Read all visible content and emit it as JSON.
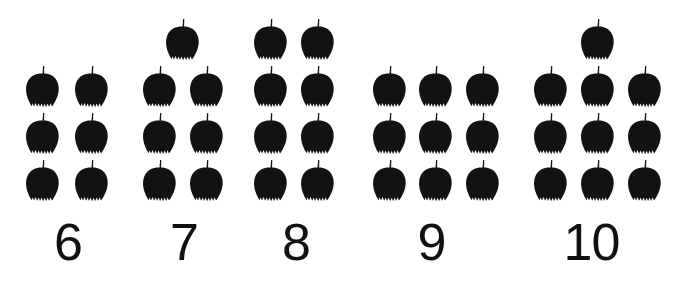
{
  "page": {
    "background_color": "#ffffff",
    "ink_color": "#111111",
    "apple_color": "#121212",
    "apple_icon_name": "apple-icon"
  },
  "groups": [
    {
      "id": "group-6",
      "label": "6",
      "count": 6,
      "columns": 2,
      "rows": 3,
      "has_extra_top_apple": false,
      "left": 0,
      "width": 136,
      "apple_positions": [
        {
          "x": 23,
          "y": 64
        },
        {
          "x": 72,
          "y": 64
        },
        {
          "x": 23,
          "y": 111
        },
        {
          "x": 72,
          "y": 111
        },
        {
          "x": 23,
          "y": 158
        },
        {
          "x": 72,
          "y": 158
        }
      ]
    },
    {
      "id": "group-7",
      "label": "7",
      "count": 7,
      "columns": 2,
      "rows": 3,
      "has_extra_top_apple": true,
      "left": 116,
      "width": 136,
      "apple_positions": [
        {
          "x": 47,
          "y": 17
        },
        {
          "x": 24,
          "y": 64
        },
        {
          "x": 71,
          "y": 64
        },
        {
          "x": 24,
          "y": 111
        },
        {
          "x": 71,
          "y": 111
        },
        {
          "x": 24,
          "y": 158
        },
        {
          "x": 71,
          "y": 158
        }
      ]
    },
    {
      "id": "group-8",
      "label": "8",
      "count": 8,
      "columns": 2,
      "rows": 4,
      "has_extra_top_apple": false,
      "left": 228,
      "width": 136,
      "apple_positions": [
        {
          "x": 23,
          "y": 17
        },
        {
          "x": 70,
          "y": 17
        },
        {
          "x": 23,
          "y": 64
        },
        {
          "x": 70,
          "y": 64
        },
        {
          "x": 23,
          "y": 111
        },
        {
          "x": 70,
          "y": 111
        },
        {
          "x": 23,
          "y": 158
        },
        {
          "x": 70,
          "y": 158
        }
      ]
    },
    {
      "id": "group-9",
      "label": "9",
      "count": 9,
      "columns": 3,
      "rows": 3,
      "has_extra_top_apple": false,
      "left": 350,
      "width": 163,
      "apple_positions": [
        {
          "x": 20,
          "y": 64
        },
        {
          "x": 66,
          "y": 64
        },
        {
          "x": 113,
          "y": 64
        },
        {
          "x": 20,
          "y": 111
        },
        {
          "x": 66,
          "y": 111
        },
        {
          "x": 113,
          "y": 111
        },
        {
          "x": 20,
          "y": 158
        },
        {
          "x": 66,
          "y": 158
        },
        {
          "x": 113,
          "y": 158
        }
      ]
    },
    {
      "id": "group-10",
      "label": "10",
      "count": 10,
      "columns": 3,
      "rows": 3,
      "has_extra_top_apple": true,
      "left": 510,
      "width": 163,
      "apple_positions": [
        {
          "x": 68,
          "y": 17
        },
        {
          "x": 21,
          "y": 64
        },
        {
          "x": 68,
          "y": 64
        },
        {
          "x": 115,
          "y": 64
        },
        {
          "x": 21,
          "y": 111
        },
        {
          "x": 68,
          "y": 111
        },
        {
          "x": 115,
          "y": 111
        },
        {
          "x": 21,
          "y": 158
        },
        {
          "x": 68,
          "y": 158
        },
        {
          "x": 115,
          "y": 158
        }
      ]
    }
  ]
}
